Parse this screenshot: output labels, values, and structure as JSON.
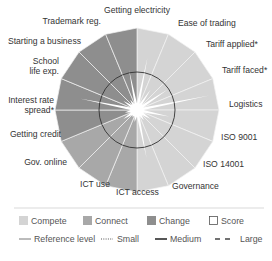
{
  "chart_data": {
    "type": "polar-area",
    "title": "",
    "center": [
      137,
      110
    ],
    "outer_radius": 82,
    "reference_radius": 38,
    "segments": [
      {
        "label": "Getting electricity",
        "group": "Compete",
        "value": 100,
        "score": 65
      },
      {
        "label": "Ease of trading",
        "group": "Compete",
        "value": 100,
        "score": 30
      },
      {
        "label": "Tariff applied*",
        "group": "Compete",
        "value": 100,
        "score": 45
      },
      {
        "label": "Tariff faced*",
        "group": "Compete",
        "value": 100,
        "score": 90
      },
      {
        "label": "Logistics",
        "group": "Compete",
        "value": 100,
        "score": 40
      },
      {
        "label": "ISO 9001",
        "group": "Compete",
        "value": 100,
        "score": 20
      },
      {
        "label": "ISO 14001",
        "group": "Compete",
        "value": 100,
        "score": 15
      },
      {
        "label": "Governance",
        "group": "Compete",
        "value": 100,
        "score": 60
      },
      {
        "label": "ICT access",
        "group": "Connect",
        "value": 100,
        "score": 15
      },
      {
        "label": "ICT use",
        "group": "Connect",
        "value": 100,
        "score": 10
      },
      {
        "label": "Gov. online",
        "group": "Connect",
        "value": 100,
        "score": 20
      },
      {
        "label": "Getting credit",
        "group": "Change",
        "value": 100,
        "score": 15
      },
      {
        "label": "Interest rate spread*",
        "group": "Change",
        "value": 100,
        "score": 70
      },
      {
        "label": "School life exp.",
        "group": "Change",
        "value": 100,
        "score": 20
      },
      {
        "label": "Starting a business",
        "group": "Change",
        "value": 100,
        "score": 15
      },
      {
        "label": "Trademark reg.",
        "group": "Change",
        "value": 100,
        "score": 50
      }
    ],
    "legend": [
      {
        "label": "Compete",
        "color": "#d4d4d4"
      },
      {
        "label": "Connect",
        "color": "#a8a8a8"
      },
      {
        "label": "Change",
        "color": "#8e8e8e"
      },
      {
        "label": "Score",
        "color": "#ffffff"
      }
    ],
    "line_legend": [
      {
        "label": "Reference level",
        "style": "thin"
      },
      {
        "label": "Small",
        "style": "dotted"
      },
      {
        "label": "Medium",
        "style": "thick"
      },
      {
        "label": "Large",
        "style": "dashed"
      }
    ]
  },
  "labels": {
    "getting_electricity": "Getting electricity",
    "ease_of_trading": "Ease of trading",
    "tariff_applied": "Tariff applied*",
    "tariff_faced": "Tariff faced*",
    "logistics": "Logistics",
    "iso9001": "ISO 9001",
    "iso14001": "ISO 14001",
    "governance": "Governance",
    "ict_access": "ICT access",
    "ict_use": "ICT use",
    "gov_online": "Gov. online",
    "getting_credit": "Getting credit",
    "interest_rate_1": "Interest rate",
    "interest_rate_2": "spread*",
    "school_1": "School",
    "school_2": "life exp.",
    "starting_business": "Starting a business",
    "trademark": "Trademark reg."
  },
  "legend": {
    "compete": "Compete",
    "connect": "Connect",
    "change": "Change",
    "score": "Score",
    "reference": "Reference level",
    "small": "Small",
    "medium": "Medium",
    "large": "Large"
  },
  "colors": {
    "compete": "#d4d4d4",
    "connect": "#a8a8a8",
    "change": "#8e8e8e",
    "divider": "#f2f2f2",
    "reference_line": "#333333"
  }
}
